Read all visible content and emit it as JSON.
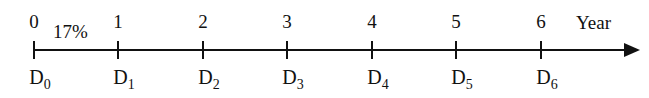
{
  "timeline": {
    "rate_label": "17%",
    "axis_label": "Year",
    "ticks": [
      {
        "year": "0",
        "d": "D",
        "sub": "0",
        "x": 34
      },
      {
        "year": "1",
        "d": "D",
        "sub": "1",
        "x": 118
      },
      {
        "year": "2",
        "d": "D",
        "sub": "2",
        "x": 203
      },
      {
        "year": "3",
        "d": "D",
        "sub": "3",
        "x": 287
      },
      {
        "year": "4",
        "d": "D",
        "sub": "4",
        "x": 372
      },
      {
        "year": "5",
        "d": "D",
        "sub": "5",
        "x": 456
      },
      {
        "year": "6",
        "d": "D",
        "sub": "6",
        "x": 541
      }
    ],
    "line_color": "#111111"
  }
}
